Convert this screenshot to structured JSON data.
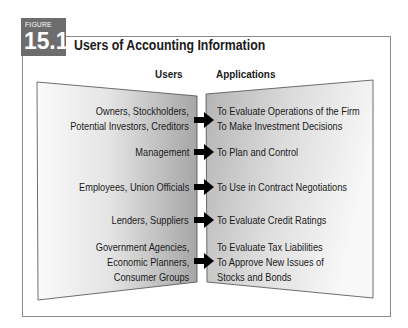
{
  "figure": {
    "label": "FIGURE",
    "number": "15.1",
    "title": "Users of Accounting Information"
  },
  "columns": {
    "users": "Users",
    "applications": "Applications"
  },
  "rows": [
    {
      "users": [
        "Owners, Stockholders,",
        "Potential Investors, Creditors"
      ],
      "applications": [
        "To Evaluate Operations of the Firm",
        "To Make Investment Decisions"
      ]
    },
    {
      "users": [
        "Management"
      ],
      "applications": [
        "To Plan and Control"
      ]
    },
    {
      "users": [
        "Employees, Union Officials"
      ],
      "applications": [
        "To Use in Contract Negotiations"
      ]
    },
    {
      "users": [
        "Lenders, Suppliers"
      ],
      "applications": [
        "To Evaluate Credit Ratings"
      ]
    },
    {
      "users": [
        "Government Agencies,",
        "Economic Planners,",
        "Consumer Groups"
      ],
      "applications": [
        "To Evaluate Tax Liabilities",
        "To Approve New Issues of",
        "Stocks and Bonds"
      ]
    }
  ],
  "colors": {
    "badge": "#6d6d6d",
    "frame": "#8a8a8a",
    "arrow": "#000000",
    "panel_light": "#f6f6f6",
    "panel_dark": "#a9a9a9"
  }
}
